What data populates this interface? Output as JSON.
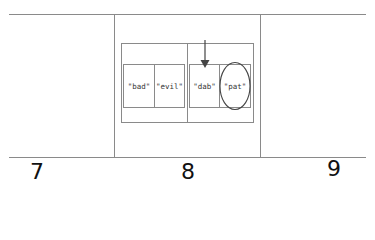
{
  "diagram": {
    "slots": [
      {
        "label": "7"
      },
      {
        "label": "8"
      },
      {
        "label": "9"
      }
    ],
    "bucket": {
      "groups": [
        {
          "items": [
            "\"bad\"",
            "\"evil\""
          ]
        },
        {
          "items": [
            "\"dab\"",
            "\"pat\""
          ]
        }
      ],
      "pointer": {
        "target": "\"dab\"",
        "glyph": "down-arrow"
      },
      "highlighted": "\"pat\""
    },
    "colors": {
      "line": "#8a8a8a",
      "arrow": "#444444",
      "text": "#111111"
    }
  }
}
